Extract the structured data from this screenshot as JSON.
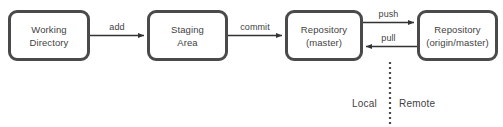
{
  "diagram": {
    "background_color": "#ffffff",
    "stroke_color": "#4a4a4a",
    "text_color": "#3f3f3f",
    "nodes": [
      {
        "id": "working-directory",
        "line1": "Working",
        "line2": "Directory"
      },
      {
        "id": "staging-area",
        "line1": "Staging",
        "line2": "Area"
      },
      {
        "id": "repository-master",
        "line1": "Repository",
        "line2": "(master)"
      },
      {
        "id": "repository-origin-master",
        "line1": "Repository",
        "line2": "(origin/master)"
      }
    ],
    "edges": [
      {
        "id": "add",
        "label": "add",
        "from": "working-directory",
        "to": "staging-area",
        "direction": "right"
      },
      {
        "id": "commit",
        "label": "commit",
        "from": "staging-area",
        "to": "repository-master",
        "direction": "right"
      },
      {
        "id": "push",
        "label": "push",
        "from": "repository-master",
        "to": "repository-origin-master",
        "direction": "right"
      },
      {
        "id": "pull",
        "label": "pull",
        "from": "repository-origin-master",
        "to": "repository-master",
        "direction": "left"
      }
    ],
    "zones": [
      {
        "id": "local",
        "label": "Local"
      },
      {
        "id": "remote",
        "label": "Remote"
      }
    ],
    "divider": {
      "id": "local-remote-divider",
      "style": "dotted"
    }
  }
}
